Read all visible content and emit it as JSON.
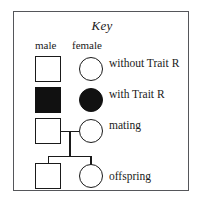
{
  "key": {
    "title": "Key",
    "columns": [
      {
        "name": "male-column",
        "label": "male"
      },
      {
        "name": "female-column",
        "label": "female"
      }
    ],
    "rows": [
      {
        "name": "without-trait",
        "label": "without Trait R",
        "male_symbol": "open-square",
        "female_symbol": "open-circle",
        "filled": false
      },
      {
        "name": "with-trait",
        "label": "with Trait R",
        "male_symbol": "filled-square",
        "female_symbol": "filled-circle",
        "filled": true
      },
      {
        "name": "mating",
        "label": "mating",
        "male_symbol": "open-square",
        "female_symbol": "open-circle",
        "filled": false
      },
      {
        "name": "offspring",
        "label": "offspring",
        "male_symbol": "open-square",
        "female_symbol": "open-circle",
        "filled": false
      }
    ],
    "colors": {
      "symbol_outline": "#1a1a1a",
      "symbol_fill": "#111111",
      "panel_border": "#55565a",
      "background": "#ffffff",
      "text": "#1a1a1a"
    }
  }
}
